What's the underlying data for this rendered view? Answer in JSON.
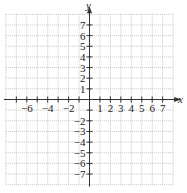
{
  "diagram": {
    "type": "coordinate-plane",
    "x_axis_label": "x",
    "y_axis_label": "y",
    "x_range": [
      -8,
      8
    ],
    "y_range": [
      -8,
      8
    ],
    "x_tick_labels": [
      "−6",
      "−4",
      "−2",
      "1",
      "2",
      "3",
      "4",
      "5",
      "6",
      "7"
    ],
    "x_tick_values": [
      -6,
      -4,
      -2,
      1,
      2,
      3,
      4,
      5,
      6,
      7
    ],
    "y_tick_labels": [
      "7",
      "6",
      "5",
      "4",
      "3",
      "2",
      "1",
      "−2",
      "−3",
      "−4",
      "−5",
      "−6",
      "−7"
    ],
    "y_tick_values": [
      7,
      6,
      5,
      4,
      3,
      2,
      1,
      -2,
      -3,
      -4,
      -5,
      -6,
      -7
    ],
    "grid": "dotted",
    "colors": {
      "axis": "#333333",
      "grid": "#b8b8b8",
      "text": "#222222"
    }
  }
}
